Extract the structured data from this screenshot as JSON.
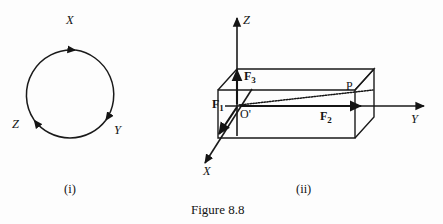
{
  "figure": {
    "caption": "Figure 8.8",
    "panels": [
      {
        "id": "panel-i",
        "label": "(i)",
        "type": "cyclic-arrow-diagram",
        "axis_labels": [
          {
            "name": "x-label",
            "text": "X"
          },
          {
            "name": "y-label",
            "text": "Y"
          },
          {
            "name": "z-label",
            "text": "Z"
          }
        ]
      },
      {
        "id": "panel-ii",
        "label": "(ii)",
        "type": "3d-axes-box-diagram",
        "axis_labels": [
          {
            "name": "z-axis-label",
            "text": "Z"
          },
          {
            "name": "y-axis-label",
            "text": "Y"
          },
          {
            "name": "x-axis-label",
            "text": "X"
          }
        ],
        "force_labels": [
          {
            "name": "force-f1-label",
            "base": "F",
            "sub": "1"
          },
          {
            "name": "force-f2-label",
            "base": "F",
            "sub": "2"
          },
          {
            "name": "force-f3-label",
            "base": "F",
            "sub": "3"
          }
        ],
        "point_labels": [
          {
            "name": "origin-label",
            "text": "O'"
          },
          {
            "name": "point-p-label",
            "text": "P"
          }
        ]
      }
    ]
  },
  "colors": {
    "ink": "#141414",
    "background": "#fdfdfd",
    "stroke": "#1a1a1a"
  }
}
